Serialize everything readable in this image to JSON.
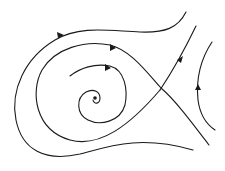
{
  "diagram": {
    "type": "phase portrait",
    "colors": {
      "stroke": "#1a1a1a",
      "background": "#ffffff"
    },
    "elements": {
      "fixed_point": {
        "kind": "stable spiral focus",
        "x": 95,
        "y": 98
      },
      "saddle": {
        "kind": "saddle point",
        "x": 161,
        "y": 88
      },
      "trajectories": [
        {
          "name": "outer-loop",
          "arrow_direction": "right (top)"
        },
        {
          "name": "middle-loop-separatrix",
          "arrow_direction": "right (top)"
        },
        {
          "name": "inner-spiral",
          "arrow_direction": "right (top)"
        },
        {
          "name": "unstable-separatrix",
          "arrow_direction": "up-right"
        },
        {
          "name": "right-arc",
          "arrow_direction": "up"
        }
      ]
    }
  }
}
